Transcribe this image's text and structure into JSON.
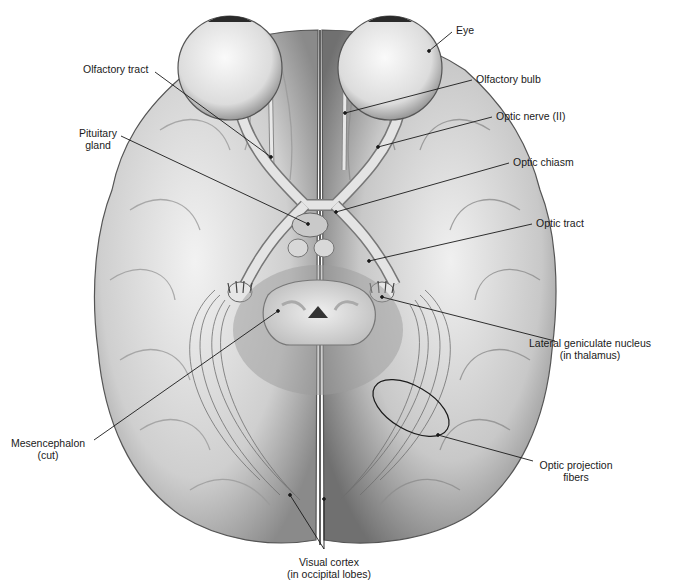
{
  "figure": {
    "type": "anatomical-illustration",
    "colors": {
      "background": "#ffffff",
      "tissue_light": "#e6e6e6",
      "tissue_mid": "#bdbdbd",
      "tissue_dark": "#7a7a7a",
      "line": "#1a1a1a"
    }
  },
  "labels": {
    "eye": {
      "text": "Eye",
      "x": 456,
      "y": 24,
      "anchor": "left",
      "target": [
        429,
        51
      ],
      "from": [
        452,
        32
      ]
    },
    "olfactory_bulb": {
      "text": "Olfactory bulb",
      "x": 476,
      "y": 73,
      "anchor": "left",
      "target": [
        345,
        113
      ],
      "from": [
        472,
        80
      ]
    },
    "optic_nerve": {
      "text": "Optic nerve (II)",
      "x": 496,
      "y": 110,
      "anchor": "left",
      "target": [
        378,
        147
      ],
      "from": [
        492,
        117
      ]
    },
    "optic_chiasm": {
      "text": "Optic chiasm",
      "x": 513,
      "y": 156,
      "anchor": "left",
      "target": [
        336,
        212
      ],
      "from": [
        509,
        163
      ]
    },
    "optic_tract": {
      "text": "Optic tract",
      "x": 536,
      "y": 217,
      "anchor": "left",
      "target": [
        369,
        261
      ],
      "from": [
        532,
        224
      ]
    },
    "lateral_geniculate_line1": {
      "text": "Lateral geniculate nucleus",
      "x": 558,
      "y": 337,
      "anchor": "center"
    },
    "lateral_geniculate_line2": {
      "text": "(in thalamus)",
      "x": 558,
      "y": 349,
      "anchor": "center",
      "target": [
        382,
        297
      ],
      "from": [
        555,
        341
      ]
    },
    "optic_projection_line1": {
      "text": "Optic projection",
      "x": 576,
      "y": 459,
      "anchor": "center"
    },
    "optic_projection_line2": {
      "text": "fibers",
      "x": 576,
      "y": 471,
      "anchor": "center",
      "target": [
        438,
        435
      ],
      "from": [
        533,
        461
      ]
    },
    "visual_cortex_line1": {
      "text": "Visual cortex",
      "x": 329,
      "y": 556,
      "anchor": "center"
    },
    "visual_cortex_line2": {
      "text": "(in occipital lobes)",
      "x": 329,
      "y": 568,
      "anchor": "center",
      "targets": [
        [
          290,
          495
        ],
        [
          324,
          499
        ]
      ],
      "from": [
        324,
        549
      ]
    },
    "mesencephalon_line1": {
      "text": "Mesencephalon",
      "x": 48,
      "y": 437,
      "anchor": "center"
    },
    "mesencephalon_line2": {
      "text": "(cut)",
      "x": 48,
      "y": 449,
      "anchor": "center",
      "target": [
        278,
        311
      ],
      "from": [
        94,
        440
      ]
    },
    "pituitary_line1": {
      "text": "Pituitary",
      "x": 108,
      "y": 127,
      "anchor": "right"
    },
    "pituitary_line2": {
      "text": "gland",
      "x": 98,
      "y": 139,
      "anchor": "center",
      "target": [
        308,
        224
      ],
      "from": [
        121,
        136
      ]
    },
    "olfactory_tract": {
      "text": "Olfactory tract",
      "x": 83,
      "y": 63,
      "anchor": "left",
      "target": [
        271,
        157
      ],
      "from": [
        155,
        72
      ]
    }
  }
}
